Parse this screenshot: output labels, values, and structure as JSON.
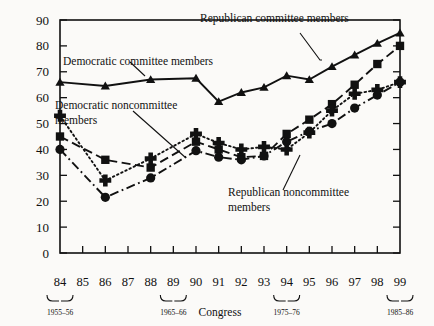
{
  "chart_data": {
    "type": "line",
    "title": "",
    "xlabel": "Congress",
    "ylabel": "",
    "ylim": [
      0,
      90
    ],
    "yticks": [
      0,
      10,
      20,
      30,
      40,
      50,
      60,
      70,
      80,
      90
    ],
    "categories": [
      "84",
      "85",
      "86",
      "87",
      "88",
      "89",
      "90",
      "91",
      "92",
      "93",
      "94",
      "95",
      "96",
      "97",
      "98",
      "99"
    ],
    "grid": false,
    "legend_position": "inline-annotations",
    "series": [
      {
        "name": "Democratic committee members",
        "marker": "triangle",
        "line_style": "solid",
        "x": [
          "84",
          "86",
          "88",
          "90",
          "91",
          "92",
          "93",
          "94",
          "95",
          "96",
          "97",
          "98",
          "99"
        ],
        "values": [
          66,
          64.5,
          67,
          67.5,
          58.5,
          62,
          64,
          68.5,
          67,
          72,
          76.5,
          81,
          85
        ]
      },
      {
        "name": "Republican committee members",
        "marker": "square",
        "line_style": "dashed",
        "x": [
          "84",
          "86",
          "88",
          "90",
          "91",
          "92",
          "93",
          "94",
          "95",
          "96",
          "97",
          "98",
          "99"
        ],
        "values": [
          45,
          36,
          33,
          43,
          40,
          37,
          37.5,
          46,
          51.5,
          57.5,
          65,
          73,
          80
        ]
      },
      {
        "name": "Democratic noncommittee members",
        "marker": "plus",
        "line_style": "dotted",
        "x": [
          "84",
          "86",
          "88",
          "90",
          "91",
          "92",
          "93",
          "94",
          "95",
          "96",
          "97",
          "98",
          "99"
        ],
        "values": [
          53,
          28,
          36.5,
          46,
          42.5,
          40,
          41,
          40,
          46.5,
          55,
          61.5,
          63,
          66
        ]
      },
      {
        "name": "Republican noncommittee members",
        "marker": "circle",
        "line_style": "dash-dot",
        "x": [
          "84",
          "86",
          "88",
          "90",
          "91",
          "92",
          "93",
          "94",
          "95",
          "96",
          "97",
          "98",
          "99"
        ],
        "values": [
          40,
          21.5,
          29,
          39.5,
          37,
          36,
          37.5,
          43,
          47,
          50,
          56,
          61,
          66
        ]
      }
    ],
    "annotations": [
      {
        "name": "republican-committee-label",
        "text": "Republican committee members"
      },
      {
        "name": "democratic-committee-label",
        "text": "Democratic committee members"
      },
      {
        "name": "democratic-noncommittee-label-line1",
        "text": "Democratic noncommittee"
      },
      {
        "name": "democratic-noncommittee-label-line2",
        "text": "members"
      },
      {
        "name": "republican-noncommittee-label-line1",
        "text": "Republican noncommittee"
      },
      {
        "name": "republican-noncommittee-label-line2",
        "text": "members"
      }
    ],
    "congress_brackets": [
      {
        "label": "1955–56",
        "over": "84"
      },
      {
        "label": "1965–66",
        "over": "89"
      },
      {
        "label": "1975–76",
        "over": "94"
      },
      {
        "label": "1985–86",
        "over": "99"
      }
    ]
  },
  "axis": {
    "x_title": "Congress",
    "y_ticks": [
      "0",
      "10",
      "20",
      "30",
      "40",
      "50",
      "60",
      "70",
      "80",
      "90"
    ],
    "x_ticks": [
      "84",
      "85",
      "86",
      "87",
      "88",
      "89",
      "90",
      "91",
      "92",
      "93",
      "94",
      "95",
      "96",
      "97",
      "98",
      "99"
    ]
  },
  "labels": {
    "rep_committee": "Republican committee members",
    "dem_committee": "Democratic committee members",
    "dem_noncommittee_1": "Democratic noncommittee",
    "dem_noncommittee_2": "members",
    "rep_noncommittee_1": "Republican noncommittee",
    "rep_noncommittee_2": "members"
  },
  "brackets": {
    "b1": "1955–56",
    "b2": "1965–66",
    "b3": "1975–76",
    "b4": "1985–86"
  },
  "colors": {
    "ink": "#111111",
    "background": "#fbfaf8"
  }
}
